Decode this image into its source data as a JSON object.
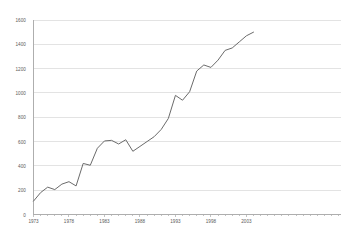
{
  "chart_data": {
    "type": "line",
    "title": "",
    "subtitle": "",
    "xlabel": "",
    "ylabel": "",
    "xlim": [
      1973,
      2004
    ],
    "ylim": [
      0,
      1600
    ],
    "grid": true,
    "legend": false,
    "legend_position": "none",
    "series_color": "#6b6b6b",
    "axis_color": "#9a9a9a",
    "grid_color": "#d0d0d0",
    "tick_label_color": "#5a5a5a",
    "y_ticks": [
      0,
      200,
      400,
      600,
      800,
      1000,
      1200,
      1400,
      1600
    ],
    "y_tick_labels": [
      "0",
      "200",
      "400",
      "600",
      "800",
      "1000",
      "1200",
      "1400",
      "1600"
    ],
    "x_ticks": [
      1973,
      1978,
      1983,
      1988,
      1993,
      1998,
      2003
    ],
    "x_tick_labels": [
      "1973",
      "1978",
      "1983",
      "1988",
      "1993",
      "1998",
      "2003"
    ],
    "x_minor_tick_interval": 1,
    "series": [
      {
        "name": "series-1",
        "color": "#6b6b6b",
        "x": [
          1973,
          1974,
          1975,
          1976,
          1977,
          1978,
          1979,
          1980,
          1981,
          1982,
          1983,
          1984,
          1985,
          1986,
          1987,
          1988,
          1989,
          1990,
          1991,
          1992,
          1993,
          1994,
          1995,
          1996,
          1997,
          1998,
          1999,
          2000,
          2001,
          2002,
          2003,
          2004
        ],
        "values": [
          110,
          180,
          225,
          205,
          250,
          270,
          235,
          420,
          405,
          545,
          605,
          610,
          580,
          615,
          520,
          560,
          600,
          640,
          700,
          790,
          980,
          940,
          1010,
          1180,
          1230,
          1210,
          1270,
          1350,
          1370,
          1420,
          1470,
          1500
        ]
      }
    ]
  }
}
